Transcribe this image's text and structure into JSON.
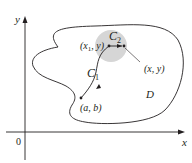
{
  "diagram": {
    "axes": {
      "x_label": "x",
      "y_label": "y",
      "origin_label": "0"
    },
    "region": {
      "label": "D"
    },
    "disk": {
      "label_base": "C",
      "label_sub": "2",
      "fill_color": "#d6d6d6"
    },
    "path": {
      "label_base": "C",
      "label_sub": "1"
    },
    "points": {
      "start": "(a, b)",
      "mid_x": "(x",
      "mid_sub": "1",
      "mid_rest": ", y)",
      "end": "(x, y)"
    },
    "colors": {
      "ink": "#231f20",
      "disk": "#d6d6d6"
    }
  }
}
